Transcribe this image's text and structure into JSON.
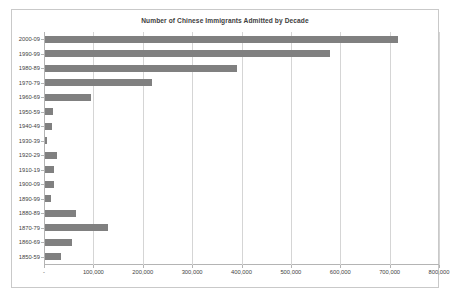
{
  "chart_data": {
    "type": "bar",
    "orientation": "horizontal",
    "title": "Number of Chinese Immigrants Admitted by Decade",
    "xlabel": "",
    "ylabel": "",
    "categories": [
      "2000-09",
      "1990-99",
      "1980-89",
      "1970-79",
      "1960-69",
      "1950-59",
      "1940-49",
      "1930-39",
      "1920-29",
      "1910-19",
      "1900-09",
      "1890-99",
      "1880-89",
      "1870-79",
      "1860-69",
      "1850-59"
    ],
    "values": [
      715000,
      577000,
      389000,
      216000,
      94000,
      17000,
      15000,
      5000,
      25000,
      18000,
      18000,
      12000,
      62000,
      128000,
      54000,
      33000
    ],
    "xlim": [
      0,
      800000
    ],
    "xticks": [
      0,
      100000,
      200000,
      300000,
      400000,
      500000,
      600000,
      700000,
      800000
    ],
    "xtick_labels": [
      "-",
      "100,000",
      "200,000",
      "300,000",
      "400,000",
      "500,000",
      "600,000",
      "700,000",
      "800,000"
    ],
    "grid": true,
    "legend": false,
    "bar_color": "#808080",
    "gridline_color": "#d5d5d5",
    "axis_color": "#b4b4b4",
    "background": "#ffffff"
  }
}
